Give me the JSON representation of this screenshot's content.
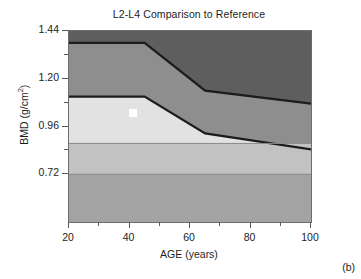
{
  "figure": {
    "caption": "(b)"
  },
  "chart_data": {
    "type": "area",
    "title": "L2-L4 Comparison to Reference",
    "xlabel": "AGE (years)",
    "ylabel_text": "BMD (g/cm",
    "ylabel_sup": "2",
    "ylabel_tail": ")",
    "ylabel": "BMD (g/cm2)",
    "xlim": [
      20,
      100
    ],
    "ylim": [
      0.48,
      1.44
    ],
    "grid": false,
    "legend": false,
    "xticks": [
      20,
      40,
      60,
      80,
      100
    ],
    "xtick_labels": [
      "20",
      "40",
      "60",
      "80",
      "100"
    ],
    "xticks_minor": [
      30,
      50,
      70,
      90
    ],
    "yticks": [
      0.72,
      0.96,
      1.2,
      1.44
    ],
    "ytick_labels": [
      "0.72",
      "0.96",
      "1.20",
      "1.44"
    ],
    "yticks_minor": [
      0.84,
      1.08,
      1.32
    ],
    "reference_bands": [
      {
        "name": "above-normal",
        "color": "#5e5e5e",
        "upper_bound": [
          [
            20,
            1.44
          ],
          [
            100,
            1.44
          ]
        ],
        "lower_bound": [
          [
            20,
            1.38
          ],
          [
            45,
            1.38
          ],
          [
            65,
            1.14
          ],
          [
            100,
            1.075
          ]
        ]
      },
      {
        "name": "normal-upper",
        "color": "#8e8e8e",
        "upper_bound": [
          [
            20,
            1.38
          ],
          [
            45,
            1.38
          ],
          [
            65,
            1.14
          ],
          [
            100,
            1.075
          ]
        ],
        "lower_bound": [
          [
            20,
            1.11
          ],
          [
            45,
            1.11
          ],
          [
            65,
            0.925
          ],
          [
            100,
            0.845
          ]
        ]
      },
      {
        "name": "normal-lower",
        "color": "#e2e2e2",
        "upper_bound": [
          [
            20,
            1.11
          ],
          [
            45,
            1.11
          ],
          [
            65,
            0.925
          ],
          [
            100,
            0.845
          ]
        ],
        "lower_bound": [
          [
            20,
            0.875
          ],
          [
            100,
            0.875
          ]
        ]
      },
      {
        "name": "osteopenia",
        "color": "#c2c2c2",
        "upper_bound": [
          [
            20,
            0.875
          ],
          [
            100,
            0.875
          ]
        ],
        "lower_bound": [
          [
            20,
            0.72
          ],
          [
            100,
            0.72
          ]
        ]
      },
      {
        "name": "osteoporosis",
        "color": "#a3a3a3",
        "upper_bound": [
          [
            20,
            0.72
          ],
          [
            100,
            0.72
          ]
        ],
        "lower_bound": [
          [
            20,
            0.48
          ],
          [
            100,
            0.48
          ]
        ]
      }
    ],
    "band_divider_color": "#1c1c1c",
    "inner_rule_color": "#8a8a8a",
    "patient_marker": {
      "name": "patient-measurement",
      "x": 41,
      "y": 1.03,
      "color": "#ffffff",
      "shape": "square",
      "size_px": 8
    }
  }
}
